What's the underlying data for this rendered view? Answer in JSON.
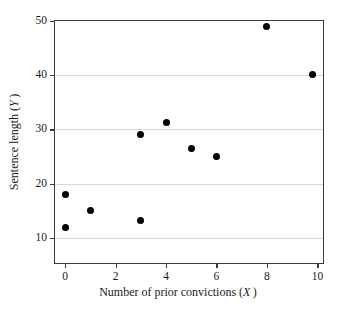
{
  "chart_data": {
    "type": "scatter",
    "title": "",
    "xlabel": "Number of prior convictions (X)",
    "ylabel": "Sentence length (Y)",
    "xlim": [
      -0.4,
      10.3
    ],
    "ylim": [
      5.0,
      50.0
    ],
    "xticks": [
      0,
      2,
      4,
      6,
      8,
      10
    ],
    "xtick_labels": [
      "0",
      "2",
      "4",
      "6",
      "8",
      "10"
    ],
    "yticks": [
      10,
      20,
      30,
      40,
      50
    ],
    "ytick_labels": [
      "10",
      "20",
      "30",
      "40",
      "50"
    ],
    "grid": "horizontal",
    "legend": "none",
    "marker": "filled-circle",
    "marker_color": "#000000",
    "frame_color": "#3a3a3a",
    "grid_color": "#d8d8d8",
    "series": [
      {
        "name": "observations",
        "points": [
          {
            "x": 0,
            "y": 18.0
          },
          {
            "x": 0,
            "y": 12.0
          },
          {
            "x": 1,
            "y": 15.0
          },
          {
            "x": 3,
            "y": 29.0
          },
          {
            "x": 3,
            "y": 13.2
          },
          {
            "x": 4,
            "y": 31.2
          },
          {
            "x": 5,
            "y": 26.5
          },
          {
            "x": 6,
            "y": 25.1
          },
          {
            "x": 8,
            "y": 49.0
          },
          {
            "x": 9.8,
            "y": 40.2
          }
        ]
      }
    ]
  }
}
